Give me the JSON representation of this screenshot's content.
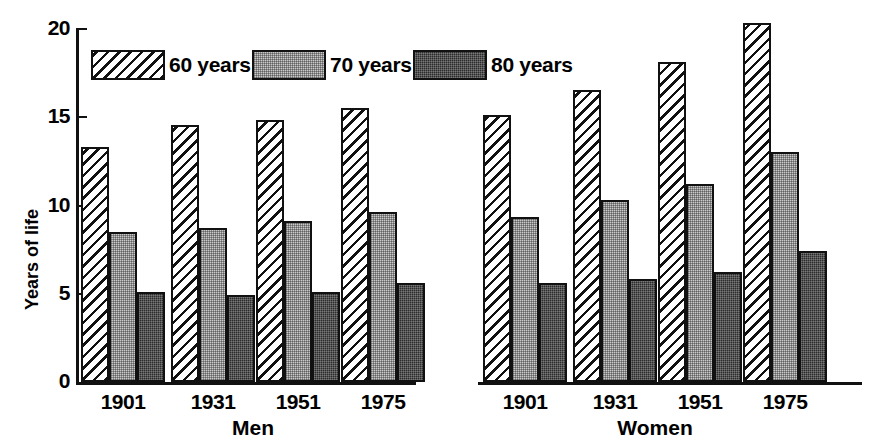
{
  "chart_data": {
    "type": "bar",
    "title": "",
    "xlabel": "",
    "ylabel": "Years of life",
    "ylim": [
      0,
      20
    ],
    "yticks": [
      0,
      5,
      10,
      15,
      20
    ],
    "grid": false,
    "legend_position": "top-inside",
    "legend": [
      "60 years",
      "70 years",
      "80 years"
    ],
    "groups": [
      "Men",
      "Women"
    ],
    "categories": [
      "1901",
      "1931",
      "1951",
      "1975"
    ],
    "series": [
      {
        "name": "60 years",
        "fill": "hatch",
        "values": {
          "Men": [
            13.3,
            14.5,
            14.8,
            15.5
          ],
          "Women": [
            15.1,
            16.5,
            18.1,
            20.3
          ]
        }
      },
      {
        "name": "70 years",
        "fill": "light-stipple",
        "values": {
          "Men": [
            8.5,
            8.7,
            9.1,
            9.6
          ],
          "Women": [
            9.3,
            10.3,
            11.2,
            13.0
          ]
        }
      },
      {
        "name": "80 years",
        "fill": "dark-stipple",
        "values": {
          "Men": [
            5.1,
            4.9,
            5.1,
            5.6
          ],
          "Women": [
            5.6,
            5.8,
            6.2,
            7.4
          ]
        }
      }
    ]
  },
  "axis": {
    "y_title": "Years of life",
    "y_tick_labels": [
      "20",
      "15",
      "10",
      "5",
      "0"
    ]
  },
  "legend": {
    "items": [
      {
        "label": "60 years",
        "swatch": "hatch-swatch"
      },
      {
        "label": "70 years",
        "swatch": "light-stipple-swatch"
      },
      {
        "label": "80 years",
        "swatch": "dark-stipple-swatch"
      }
    ]
  },
  "groups": [
    {
      "name": "Men",
      "categories": [
        "1901",
        "1931",
        "1951",
        "1975"
      ]
    },
    {
      "name": "Women",
      "categories": [
        "1901",
        "1931",
        "1951",
        "1975"
      ]
    }
  ],
  "colors": {
    "ink": "#111111",
    "light_fill": "#c9c9c9",
    "dark_fill": "#2b2b2b",
    "background": "#ffffff"
  }
}
